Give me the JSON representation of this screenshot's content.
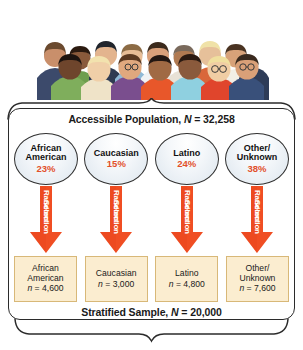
{
  "figure": {
    "illustration_alt": "crowd-of-diverse-people",
    "population": {
      "label_prefix": "Accessible Population, ",
      "n_symbol": "N",
      "n_text": " = 32,258"
    },
    "sample": {
      "label_prefix": "Stratified Sample, ",
      "n_symbol": "N",
      "n_text": " = 20,000"
    },
    "arrow_label": {
      "line1": "Random",
      "line2": "Selection"
    },
    "strata": [
      {
        "name_line1": "African",
        "name_line2": "American",
        "percent": "23%",
        "sample_line1": "African",
        "sample_line2": "American",
        "sample_n_symbol": "n",
        "sample_n_text": " = 4,600"
      },
      {
        "name_line1": "Caucasian",
        "name_line2": "",
        "percent": "15%",
        "sample_line1": "Caucasian",
        "sample_line2": "",
        "sample_n_symbol": "n",
        "sample_n_text": " = 3,000"
      },
      {
        "name_line1": "Latino",
        "name_line2": "",
        "percent": "24%",
        "sample_line1": "Latino",
        "sample_line2": "",
        "sample_n_symbol": "n",
        "sample_n_text": " = 4,800"
      },
      {
        "name_line1": "Other/",
        "name_line2": "Unknown",
        "percent": "38%",
        "sample_line1": "Other/",
        "sample_line2": "Unknown",
        "sample_n_symbol": "n",
        "sample_n_text": " = 7,600"
      }
    ],
    "colors": {
      "percent_text": "#e2502a",
      "arrow_fill": "#f04e23",
      "arrow_fill_dark": "#d9401a",
      "sample_box_fill": "#fbedd0",
      "sample_box_border": "#d8b878",
      "outline": "#2b2b2b"
    }
  }
}
